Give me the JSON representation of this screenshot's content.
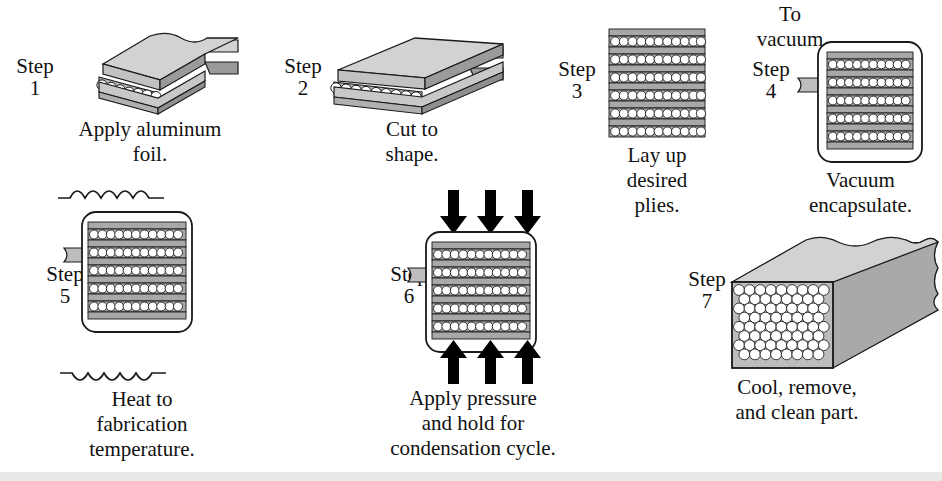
{
  "diagram": {
    "type": "process-flow-illustration",
    "step_word": "Step",
    "colors": {
      "ink": "#111111",
      "slab_top": "#d2d2d2",
      "slab_side": "#9a9a9a",
      "ply_band": "#a8a8a8",
      "fiber_circle": "#ffffff",
      "tube": "#bdbdbd",
      "arrow": "#000000",
      "background": "#ffffff"
    }
  },
  "steps": [
    {
      "id": "step-1",
      "number": "1",
      "label": "Step",
      "caption_lines": [
        "Apply aluminum",
        "foil."
      ],
      "caption": "Apply aluminum foil.",
      "art": "isometric-slab-torn-edge-with-peeling-foil",
      "fiber_count": 13
    },
    {
      "id": "step-2",
      "number": "2",
      "label": "Step",
      "caption_lines": [
        "Cut to",
        "shape."
      ],
      "caption": "Cut to shape.",
      "art": "isometric-slab-trimmed-edges",
      "fiber_count": 13
    },
    {
      "id": "step-3",
      "number": "3",
      "label": "Step",
      "caption_lines": [
        "Lay up",
        "desired",
        "plies."
      ],
      "caption": "Lay up desired plies.",
      "art": "stacked-plies-elevation",
      "ply_rows": 6,
      "band_rows": 7,
      "fibers_per_row": 11
    },
    {
      "id": "step-4",
      "number": "4",
      "label": "Step",
      "caption_lines": [
        "Vacuum",
        "encapsulate."
      ],
      "caption": "Vacuum encapsulate.",
      "annotation_lines": [
        "To",
        "vacuum"
      ],
      "annotation": "To vacuum",
      "art": "bagged-stack-with-vacuum-tube",
      "ply_rows": 5,
      "band_rows": 6,
      "fibers_per_row": 11
    },
    {
      "id": "step-5",
      "number": "5",
      "label": "Step",
      "caption_lines": [
        "Heat to",
        "fabrication",
        "temperature."
      ],
      "caption": "Heat to fabrication temperature.",
      "art": "bagged-stack-with-heat-waves",
      "ply_rows": 5,
      "band_rows": 6,
      "fibers_per_row": 11,
      "heat_symbol": "wavy-line",
      "heat_symbol_count": 2
    },
    {
      "id": "step-6",
      "number": "6",
      "label": "Step",
      "caption_lines": [
        "Apply pressure",
        "and hold for",
        "condensation cycle."
      ],
      "caption": "Apply pressure and hold for condensation cycle.",
      "art": "bagged-stack-with-pressure-arrows",
      "ply_rows": 5,
      "band_rows": 6,
      "fibers_per_row": 11,
      "arrows_top": 3,
      "arrows_bottom": 3
    },
    {
      "id": "step-7",
      "number": "7",
      "label": "Step",
      "caption_lines": [
        "Cool, remove,",
        "and clean part."
      ],
      "caption": "Cool, remove, and clean part.",
      "art": "consolidated-block-hex-packed-fibers",
      "fiber_rows": 6
    }
  ]
}
